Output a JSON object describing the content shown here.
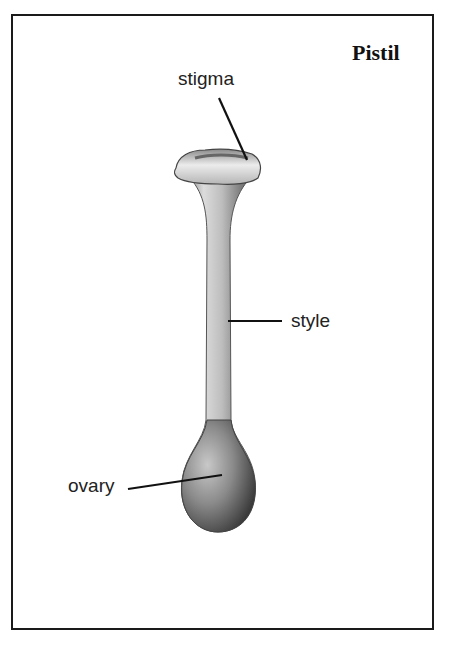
{
  "diagram": {
    "title": "Pistil",
    "labels": {
      "stigma": "stigma",
      "style": "style",
      "ovary": "ovary"
    },
    "colors": {
      "border": "#1a1a1a",
      "ink": "#111111",
      "shade_dark": "#555555",
      "shade_light": "#e8e8e8"
    }
  }
}
